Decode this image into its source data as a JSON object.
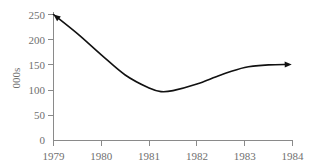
{
  "chart_data": {
    "type": "line",
    "title": "",
    "subtitle": "",
    "xlabel": "",
    "ylabel": "000s",
    "xlim": [
      1979,
      1984
    ],
    "ylim": [
      0,
      250
    ],
    "grid": false,
    "legend": null,
    "x_ticks": [
      "1979",
      "1980",
      "1981",
      "1982",
      "1983",
      "1984"
    ],
    "x_tick_values": [
      1979,
      1980,
      1981,
      1982,
      1983,
      1984
    ],
    "y_ticks": [
      "0",
      "50",
      "100",
      "150",
      "200",
      "250"
    ],
    "y_tick_values": [
      0,
      50,
      100,
      150,
      200,
      250
    ],
    "series": [
      {
        "name": "trend",
        "style": "smooth-curve",
        "color": "#111111",
        "arrow_start": true,
        "arrow_end": true,
        "x": [
          1979.0,
          1979.5,
          1980.0,
          1980.5,
          1981.0,
          1981.25,
          1981.5,
          1982.0,
          1982.5,
          1983.0,
          1983.5,
          1983.9
        ],
        "values": [
          250,
          212,
          170,
          130,
          104,
          97,
          99,
          112,
          130,
          145,
          150,
          151
        ]
      }
    ],
    "annotations": [
      {
        "name": "start-arrow",
        "x": 1979.0,
        "y": 250,
        "direction": "up-left"
      },
      {
        "name": "end-arrow",
        "x": 1983.9,
        "y": 151,
        "direction": "right"
      }
    ]
  },
  "axes": {
    "y_axis_label": "000s",
    "y_labels": [
      "250",
      "200",
      "150",
      "100",
      "50",
      "0"
    ],
    "x_labels": [
      "1979",
      "1980",
      "1981",
      "1982",
      "1983",
      "1984"
    ]
  },
  "colors": {
    "background": "#ffffff",
    "axis": "#8a8a8a",
    "text": "#6f6f6f",
    "curve": "#111111"
  }
}
